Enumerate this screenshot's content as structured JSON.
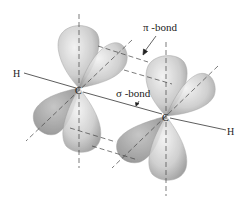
{
  "diagram": {
    "type": "molecular-orbital-illustration",
    "labels": {
      "pi_bond": "π -bond",
      "sigma_bond": "σ -bond",
      "carbon_left": "C",
      "carbon_right": "C",
      "hydrogen_left": "H",
      "hydrogen_right": "H"
    },
    "atoms": [
      {
        "id": "C1",
        "label": "C",
        "x": 79,
        "y": 88
      },
      {
        "id": "C2",
        "label": "C",
        "x": 166,
        "y": 116
      },
      {
        "id": "H1",
        "label": "H",
        "x": 13,
        "y": 73
      },
      {
        "id": "H2",
        "label": "H",
        "x": 232,
        "y": 131
      }
    ],
    "colors": {
      "lobe_fill": "#d4d4d4",
      "lobe_dark": "#8a8a8a",
      "line": "#333333",
      "background": "#ffffff"
    }
  }
}
